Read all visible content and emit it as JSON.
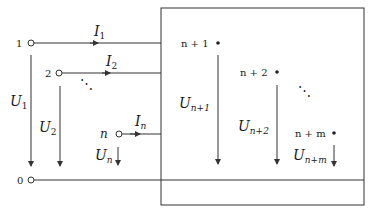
{
  "diagram": {
    "type": "multiport network (n input ports, m output nodes)",
    "colors": {
      "line": "#333333",
      "text": "#1a1a1a",
      "background": "#ffffff"
    },
    "input_terminals": [
      {
        "node": "1",
        "current": {
          "symbol": "I",
          "sub": "1"
        },
        "voltage": {
          "symbol": "U",
          "sub": "1"
        }
      },
      {
        "node": "2",
        "current": {
          "symbol": "I",
          "sub": "2"
        },
        "voltage": {
          "symbol": "U",
          "sub": "2"
        }
      },
      {
        "node": "n",
        "current": {
          "symbol": "I",
          "sub": "n"
        },
        "voltage": {
          "symbol": "U",
          "sub": "n"
        }
      }
    ],
    "reference_terminal": {
      "node": "0"
    },
    "internal_nodes": [
      {
        "node": "n + 1",
        "voltage": {
          "symbol": "U",
          "sub": "n+1"
        }
      },
      {
        "node": "n + 2",
        "voltage": {
          "symbol": "U",
          "sub": "n+2"
        }
      },
      {
        "node": "n + m",
        "voltage": {
          "symbol": "U",
          "sub": "n+m"
        }
      }
    ],
    "ellipsis": "⋱"
  }
}
